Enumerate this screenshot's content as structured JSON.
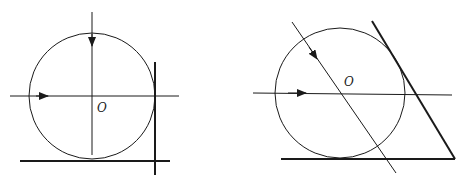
{
  "figures": [
    {
      "id": "left",
      "center_label": "O",
      "circle": {
        "cx": 92,
        "cy": 96,
        "r": 63
      },
      "axis_h": {
        "x1": 10,
        "y1": 96,
        "x2": 179,
        "y2": 96
      },
      "axis_v": {
        "x1": 92,
        "y1": 12,
        "x2": 92,
        "y2": 155
      },
      "tangent_right": {
        "x1": 155,
        "y1": 62,
        "x2": 155,
        "y2": 175
      },
      "tangent_bottom": {
        "x1": 20,
        "y1": 161,
        "x2": 170,
        "y2": 161
      },
      "label_pos": {
        "x": 97,
        "y": 112
      }
    },
    {
      "id": "right",
      "center_label": "O",
      "circle": {
        "cx": 340,
        "cy": 93,
        "r": 65
      },
      "axis_h": {
        "x1": 253,
        "y1": 93,
        "x2": 452,
        "y2": 95
      },
      "axis_diag": {
        "x1": 292,
        "y1": 22,
        "x2": 396,
        "y2": 173
      },
      "tangent_right": {
        "x1": 372,
        "y1": 21,
        "x2": 455,
        "y2": 159
      },
      "tangent_bottom": {
        "x1": 281,
        "y1": 159,
        "x2": 455,
        "y2": 159
      },
      "label_pos": {
        "x": 344,
        "y": 86
      }
    }
  ],
  "colors": {
    "stroke": "#1a1a1a",
    "background": "#ffffff"
  }
}
